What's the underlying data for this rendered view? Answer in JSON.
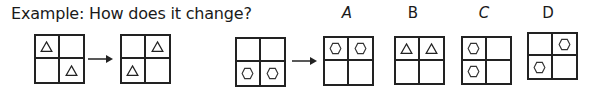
{
  "question": {
    "title": "Example: How does it change?"
  },
  "example": {
    "before": {
      "cells": [
        "triangle",
        "",
        "",
        "triangle"
      ]
    },
    "after": {
      "cells": [
        "",
        "triangle",
        "triangle",
        ""
      ]
    }
  },
  "problem": {
    "before": {
      "cells": [
        "",
        "",
        "hexagon",
        "hexagon"
      ]
    }
  },
  "options": [
    {
      "label": "A",
      "cells": [
        "hexagon",
        "hexagon",
        "",
        ""
      ]
    },
    {
      "label": "B",
      "cells": [
        "triangle",
        "triangle",
        "",
        ""
      ]
    },
    {
      "label": "C",
      "cells": [
        "hexagon",
        "",
        "hexagon",
        ""
      ]
    },
    {
      "label": "D",
      "cells": [
        "",
        "hexagon",
        "hexagon",
        ""
      ]
    }
  ],
  "colors": {
    "stroke": "#222222",
    "background": "#ffffff"
  }
}
